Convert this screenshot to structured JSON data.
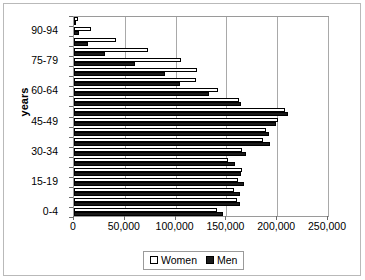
{
  "chart_data": {
    "type": "bar",
    "orientation": "horizontal",
    "title": "",
    "xlabel": "",
    "ylabel": "years",
    "xlim": [
      0,
      250000
    ],
    "ylim": null,
    "grid": true,
    "legend_position": "bottom",
    "xticks": [
      "0",
      "50,000",
      "100,000",
      "150,000",
      "200,000",
      "250,000"
    ],
    "xtick_values": [
      0,
      50000,
      100000,
      150000,
      200000,
      250000
    ],
    "ytick_labels": [
      "90-94",
      "75-79",
      "60-64",
      "45-49",
      "30-34",
      "15-19",
      "0-4"
    ],
    "categories": [
      "95+",
      "90-94",
      "85-89",
      "80-84",
      "75-79",
      "70-74",
      "65-69",
      "60-64",
      "55-59",
      "50-54",
      "45-49",
      "40-44",
      "35-39",
      "30-34",
      "25-29",
      "20-24",
      "15-19",
      "10-14",
      "5-9",
      "0-4"
    ],
    "series": [
      {
        "name": "Women",
        "color": "#ffffff",
        "values": [
          4000,
          17000,
          41000,
          73000,
          105000,
          121000,
          120000,
          142000,
          162000,
          208000,
          201000,
          189000,
          186000,
          165000,
          152000,
          165000,
          161000,
          157000,
          160000,
          141000
        ]
      },
      {
        "name": "Men",
        "color": "#1a1a1a",
        "values": [
          1000,
          5000,
          14000,
          31000,
          60000,
          90000,
          104000,
          133000,
          164000,
          211000,
          199000,
          192000,
          193000,
          169000,
          158000,
          164000,
          167000,
          163000,
          163000,
          147000
        ]
      }
    ]
  },
  "legend": {
    "items": [
      {
        "label": "Women",
        "swatch": "hollow-square"
      },
      {
        "label": "Men",
        "swatch": "filled-square"
      }
    ]
  },
  "axis": {
    "y_title": "years"
  },
  "colors": {
    "men": "#1a1a1a",
    "women": "#ffffff",
    "gridline": "#a9a9a9",
    "border": "#9a9a9a",
    "text": "#000000"
  }
}
